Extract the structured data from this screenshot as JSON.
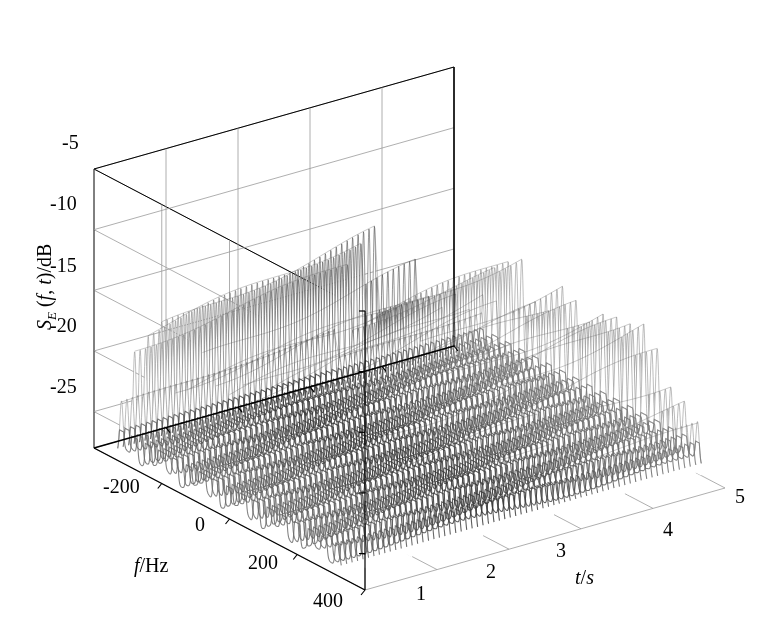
{
  "figure": {
    "kind": "3d-surface-mesh",
    "background_color": "#ffffff",
    "line_color": "#000000",
    "grid_color": "#9a9a9a",
    "mesh_color": "#555555"
  },
  "axes": {
    "z": {
      "label_parts": {
        "main": "S",
        "sub": "E",
        "args": " (f, t)",
        "unit": "/dB"
      },
      "label_text": "S_E (f, t)/dB",
      "ticks": [
        "-5",
        "-10",
        "-15",
        "-20",
        "-25"
      ],
      "values": [
        -5,
        -10,
        -15,
        -20,
        -25
      ],
      "range": [
        -28,
        -5
      ]
    },
    "x": {
      "label_text": "f/Hz",
      "label_italic": "f",
      "label_rest": "/Hz",
      "ticks": [
        "-200",
        "0",
        "200",
        "400"
      ],
      "values": [
        -200,
        0,
        200,
        400
      ],
      "range": [
        -400,
        400
      ]
    },
    "y": {
      "label_text": "t/s",
      "label_italic": "t",
      "label_rest": "/s",
      "ticks": [
        "1",
        "2",
        "3",
        "4",
        "5"
      ],
      "values": [
        1,
        2,
        3,
        4,
        5
      ],
      "range": [
        0,
        5
      ]
    }
  },
  "chart_data": {
    "type": "surface",
    "title": "",
    "xlabel": "f/Hz",
    "ylabel": "t/s",
    "zlabel": "S_E (f, t)/dB",
    "xlim": [
      -400,
      400
    ],
    "ylim": [
      0,
      5
    ],
    "zlim": [
      -28,
      -5
    ],
    "grid": true,
    "legend": "none",
    "x": [
      -400,
      -350,
      -300,
      -250,
      -200,
      -150,
      -100,
      -50,
      0,
      50,
      100,
      150,
      200,
      250,
      300,
      350,
      400
    ],
    "y": [
      0,
      0.25,
      0.5,
      0.75,
      1,
      1.25,
      1.5,
      1.75,
      2,
      2.25,
      2.5,
      2.75,
      3,
      3.25,
      3.5,
      3.75,
      4,
      4.25,
      4.5,
      4.75,
      5
    ],
    "baseline_db": -27,
    "peak_spacing_hz": 40,
    "peak_db_before_step": -11,
    "peak_db_after_step": -17,
    "step_time_s": 3.0,
    "envelope_center_hz": 0,
    "envelope_halfwidth_hz": 330,
    "series": [
      {
        "name": "peak envelope before step",
        "t_range": [
          0,
          3
        ],
        "peak_db": -11
      },
      {
        "name": "peak envelope after step",
        "t_range": [
          3,
          5
        ],
        "peak_db": -17
      },
      {
        "name": "noise floor",
        "t_range": [
          0,
          5
        ],
        "peak_db": -27
      }
    ]
  },
  "geometry": {
    "origin_front_x": 365,
    "origin_front_y": 590
  }
}
